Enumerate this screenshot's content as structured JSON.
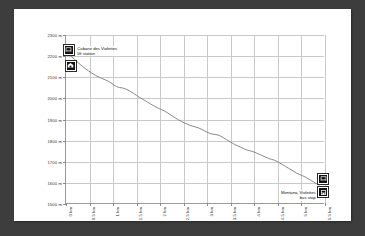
{
  "chart_data": {
    "type": "line",
    "title": "",
    "xlabel": "",
    "ylabel": "",
    "xlim": [
      0,
      5.5
    ],
    "ylim": [
      1500,
      2300
    ],
    "grid": true,
    "legend": "none",
    "y_ticks": [
      "2300 m",
      "2200 m",
      "2100 m",
      "2000 m",
      "1900 m",
      "1800 m",
      "1700 m",
      "1600 m",
      "1500 m"
    ],
    "y_tick_values": [
      2300,
      2200,
      2100,
      2000,
      1900,
      1800,
      1700,
      1600,
      1500
    ],
    "x_ticks": [
      "0 km",
      "0.5 km",
      "1 km",
      "1.5 km",
      "2 km",
      "2.5 km",
      "3 km",
      "3.5 km",
      "4 km",
      "4.5 km",
      "5 km",
      "5.5 km"
    ],
    "x_tick_values": [
      0,
      0.5,
      1,
      1.5,
      2,
      2.5,
      3,
      3.5,
      4,
      4.5,
      5,
      5.5
    ],
    "series": [
      {
        "name": "elevation-profile",
        "color": "#7a7a7a",
        "x": [
          0.0,
          0.06,
          0.12,
          0.18,
          0.24,
          0.3,
          0.36,
          0.42,
          0.48,
          0.54,
          0.6,
          0.66,
          0.72,
          0.78,
          0.84,
          0.9,
          0.96,
          1.02,
          1.08,
          1.14,
          1.2,
          1.26,
          1.32,
          1.38,
          1.44,
          1.5,
          1.56,
          1.62,
          1.68,
          1.74,
          1.8,
          1.86,
          1.92,
          1.98,
          2.04,
          2.1,
          2.16,
          2.22,
          2.28,
          2.34,
          2.4,
          2.46,
          2.52,
          2.58,
          2.64,
          2.7,
          2.76,
          2.82,
          2.88,
          2.94,
          3.0,
          3.06,
          3.12,
          3.18,
          3.24,
          3.3,
          3.36,
          3.42,
          3.48,
          3.54,
          3.6,
          3.66,
          3.72,
          3.78,
          3.84,
          3.9,
          3.96,
          4.02,
          4.08,
          4.14,
          4.2,
          4.26,
          4.32,
          4.38,
          4.44,
          4.5,
          4.56,
          4.62,
          4.68,
          4.74,
          4.8,
          4.86,
          4.92,
          4.98,
          5.04,
          5.1,
          5.16,
          5.22,
          5.28,
          5.34,
          5.4
        ],
        "y": [
          2215,
          2208,
          2196,
          2184,
          2172,
          2160,
          2149,
          2139,
          2129,
          2120,
          2112,
          2104,
          2098,
          2092,
          2086,
          2080,
          2072,
          2062,
          2054,
          2050,
          2048,
          2044,
          2038,
          2030,
          2022,
          2013,
          2004,
          1996,
          1988,
          1980,
          1972,
          1964,
          1957,
          1950,
          1944,
          1938,
          1930,
          1921,
          1912,
          1904,
          1896,
          1888,
          1882,
          1876,
          1870,
          1866,
          1862,
          1858,
          1852,
          1845,
          1838,
          1832,
          1828,
          1826,
          1824,
          1818,
          1810,
          1802,
          1794,
          1786,
          1778,
          1772,
          1766,
          1760,
          1754,
          1750,
          1746,
          1742,
          1736,
          1730,
          1724,
          1718,
          1712,
          1708,
          1704,
          1698,
          1690,
          1682,
          1674,
          1666,
          1658,
          1650,
          1642,
          1636,
          1630,
          1624,
          1616,
          1608,
          1600,
          1592,
          1586
        ]
      }
    ],
    "annotations": [
      {
        "id": "cabane-des-violettes",
        "label": "Cabane des Violettes\nlift station",
        "label_line1": "Cabane des Violettes",
        "label_line2": "lift station",
        "icon": "lift-station-icon",
        "x": 0.06,
        "y": 2230,
        "label_side": "right"
      },
      {
        "id": "mountain-hut",
        "label": "",
        "icon": "mountain-hut-icon",
        "x": 0.1,
        "y": 2155,
        "label_side": "none"
      },
      {
        "id": "montana-violettes-lift",
        "label": "",
        "icon": "lift-station-icon",
        "x": 5.46,
        "y": 1620,
        "label_side": "none"
      },
      {
        "id": "montana-violettes-bus-stop",
        "label": "Montana, Violettes\nbus stop",
        "label_line1": "Montana, Violettes",
        "label_line2": "bus stop",
        "icon": "bus-stop-icon",
        "x": 5.46,
        "y": 1556,
        "label_side": "left"
      }
    ]
  },
  "colors": {
    "page_background": "#3d3d3d",
    "card_background": "#ffffff",
    "grid": "#c9c9c9",
    "axis": "#9a9a9a",
    "line": "#7a7a7a",
    "marker": "#111111",
    "text": "#333333"
  }
}
